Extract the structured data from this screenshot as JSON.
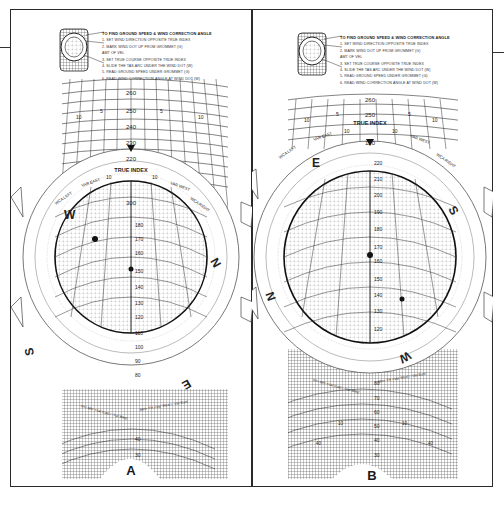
{
  "figure": {
    "panels": [
      {
        "id": "A",
        "label": "A",
        "instructions": {
          "title": "TO FIND GROUND SPEED & WIND CORRECTION ANGLE",
          "steps": [
            "1. SET WIND DIRECTION OPPOSITE TRUE INDEX",
            "2. MARK WIND DOT UP FROM GROMMET (G)",
            "   AMT OF VEL",
            "3. SET TRUE COURSE OPPOSITE TRUE INDEX",
            "4. SLIDE THE TAS ARC UNDER THE WIND DOT (W)",
            "5. READ GROUND SPEED UNDER GROMMET (G)",
            "6. READ WIND CORRECTION ANGLE AT WIND DOT (W)"
          ]
        },
        "slide_scale_top": [
          "260",
          "250",
          "240",
          "230",
          "220"
        ],
        "slide_side_marks": [
          "10",
          "5",
          "5",
          "10"
        ],
        "true_index_label": "TRUE INDEX",
        "true_index_marks": [
          "10",
          "10",
          "20",
          "20"
        ],
        "var_labels": [
          "VAR EAST",
          "VAR WEST"
        ],
        "wca_labels": [
          "WCA LEFT",
          "WCA RIGHT"
        ],
        "compass_rose": {
          "heading_at_index": "300",
          "cardinals": [
            "W",
            "N",
            "E",
            "S"
          ],
          "degree_labels": [
            "240",
            "250",
            "260",
            "270",
            "280",
            "290",
            "300",
            "310",
            "320",
            "330",
            "340",
            "350",
            "10",
            "20",
            "30",
            "40",
            "50",
            "60",
            "70",
            "80",
            "90",
            "100",
            "110",
            "120",
            "130",
            "140",
            "150",
            "160",
            "170",
            "180",
            "190",
            "200",
            "210",
            "220",
            "230"
          ]
        },
        "grid_speeds": [
          "180",
          "170",
          "160",
          "150",
          "140",
          "130",
          "120",
          "110",
          "100",
          "90",
          "80"
        ],
        "grid_side_marks": [
          "10",
          "10",
          "20",
          "20"
        ],
        "lower_speeds": [
          "40",
          "30"
        ],
        "formulas": [
          "TH=TC -WCA Left / +WCA Right",
          "TH= MH +Var East / -Var West",
          "MH= TH +Var West / -Var East",
          "TC=TH +WCA Left / -WCA Right"
        ],
        "grommet_value": "130"
      },
      {
        "id": "B",
        "label": "B",
        "instructions": {
          "title": "TO FIND GROUND SPEED & WIND CORRECTION ANGLE",
          "steps": [
            "1. SET WIND DIRECTION OPPOSITE TRUE INDEX",
            "2. MARK WIND DOT UP FROM GROMMET (G)",
            "   AMT OF VEL",
            "3. SET TRUE COURSE OPPOSITE TRUE INDEX",
            "4. SLIDE THE TAS ARC UNDER THE WIND DOT (W)",
            "5. READ GROUND SPEED UNDER GROMMET (G)",
            "6. READ WIND CORRECTION ANGLE AT WIND DOT (W)"
          ]
        },
        "slide_scale_top": [
          "260",
          "250"
        ],
        "slide_side_marks": [
          "10",
          "5",
          "5",
          "10"
        ],
        "true_index_label": "TRUE INDEX",
        "true_index_marks": [
          "10",
          "10",
          "20",
          "20"
        ],
        "var_labels": [
          "VAR EAST",
          "VAR WEST"
        ],
        "wca_labels": [
          "WCA LEFT",
          "WCA RIGHT"
        ],
        "compass_rose": {
          "heading_at_index": "120",
          "cardinals": [
            "E",
            "S",
            "W",
            "N"
          ],
          "degree_labels": [
            "60",
            "70",
            "80",
            "90",
            "100",
            "110",
            "120",
            "130",
            "140",
            "150",
            "160",
            "170",
            "190",
            "200",
            "210",
            "220",
            "230",
            "240",
            "250",
            "260",
            "280",
            "290",
            "300",
            "310",
            "320",
            "330",
            "340",
            "10",
            "20",
            "30",
            "40",
            "50"
          ]
        },
        "grid_speeds": [
          "220",
          "210",
          "200",
          "190",
          "180",
          "170",
          "160",
          "150",
          "140",
          "130",
          "120"
        ],
        "grid_side_marks": [
          "10",
          "5",
          "5",
          "10",
          "10",
          "10"
        ],
        "lower_speeds": [
          "80",
          "70",
          "60",
          "50",
          "40",
          "30"
        ],
        "lower_side_marks": [
          "10",
          "10",
          "40",
          "40"
        ],
        "formulas": [
          "TH=TC -WCA Left / +WCA Right",
          "TH= MH +Var East / -Var West",
          "MH= TH +Var West / -Var East",
          "TC=TH +WCA Left / -WCA Right"
        ],
        "grommet_value": "165"
      }
    ]
  }
}
